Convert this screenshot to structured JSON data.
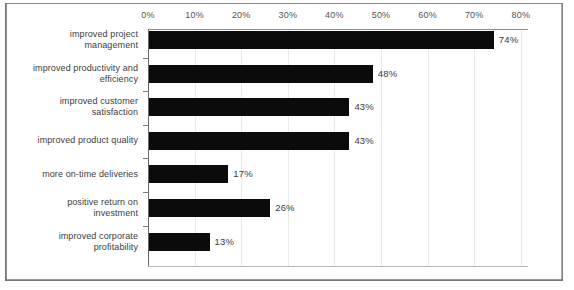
{
  "chart_data": {
    "type": "bar",
    "orientation": "horizontal",
    "title": "",
    "subtitle": "",
    "xlabel": "",
    "ylabel": "",
    "xlim": [
      0,
      80
    ],
    "grid": true,
    "legend": false,
    "x_tick_labels": [
      "0%",
      "10%",
      "20%",
      "30%",
      "40%",
      "50%",
      "60%",
      "70%",
      "80%"
    ],
    "x_tick_values": [
      0,
      10,
      20,
      30,
      40,
      50,
      60,
      70,
      80
    ],
    "categories": [
      "improved project management",
      "improved productivity and efficiency",
      "improved customer satisfaction",
      "improved product quality",
      "more on-time deliveries",
      "positive return on investment",
      "improved corporate profitability"
    ],
    "values": [
      74,
      48,
      43,
      43,
      17,
      26,
      13
    ],
    "value_labels": [
      "74%",
      "48%",
      "43%",
      "43%",
      "17%",
      "26%",
      "13%"
    ],
    "bar_color": "#0b0b0b",
    "background_color": "#ffffff"
  },
  "bars": [
    {
      "label_line1": "improved project",
      "label_line2": "management",
      "value": 74,
      "value_label": "74%"
    },
    {
      "label_line1": "improved productivity and",
      "label_line2": "efficiency",
      "value": 48,
      "value_label": "48%"
    },
    {
      "label_line1": "improved customer",
      "label_line2": "satisfaction",
      "value": 43,
      "value_label": "43%"
    },
    {
      "label_line1": "improved product quality",
      "label_line2": "",
      "value": 43,
      "value_label": "43%"
    },
    {
      "label_line1": "more on-time deliveries",
      "label_line2": "",
      "value": 17,
      "value_label": "17%"
    },
    {
      "label_line1": "positive return on",
      "label_line2": "investment",
      "value": 26,
      "value_label": "26%"
    },
    {
      "label_line1": "improved corporate",
      "label_line2": "profitability",
      "value": 13,
      "value_label": "13%"
    }
  ],
  "axis": {
    "ticks": [
      "0%",
      "10%",
      "20%",
      "30%",
      "40%",
      "50%",
      "60%",
      "70%",
      "80%"
    ]
  }
}
